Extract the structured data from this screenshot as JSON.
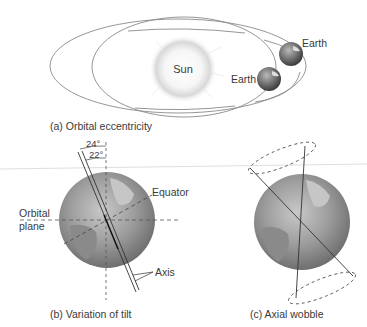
{
  "panel_a": {
    "caption": "(a) Orbital eccentricity",
    "sun_label": "Sun",
    "earth_label_1": "Earth",
    "earth_label_2": "Earth"
  },
  "panel_b": {
    "caption": "(b) Variation of tilt",
    "angle_outer": "24°",
    "angle_inner": "22°",
    "equator_label": "Equator",
    "orbital_plane_label_1": "Orbital",
    "orbital_plane_label_2": "plane",
    "axis_label": "Axis"
  },
  "panel_c": {
    "caption": "(c) Axial wobble"
  },
  "colors": {
    "orbit_line": "#8a8a8a",
    "globe_base": "#9a9a9a",
    "text": "#3a3a3a",
    "divider": "#d0d0d0"
  }
}
